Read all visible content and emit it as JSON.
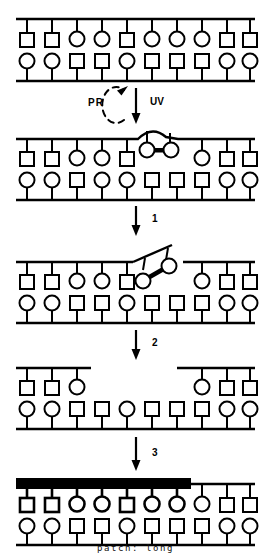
{
  "figure": {
    "caption": "patch: long",
    "stroke_color": "#000000",
    "patch_color": "#000000",
    "background": "#ffffff",
    "base_symbols": {
      "square": "square",
      "circle": "circle"
    },
    "labels": {
      "pr": "PR",
      "uv": "UV",
      "step1": "1",
      "step2": "2",
      "step3": "3"
    },
    "panels": [
      {
        "id": "panel-undamaged-dna",
        "name": "undamaged-duplex",
        "top_strand": [
          "square",
          "square",
          "circle",
          "circle",
          "square",
          "circle",
          "circle",
          "circle",
          "square",
          "square"
        ],
        "bottom_strand": [
          "circle",
          "circle",
          "square",
          "square",
          "circle",
          "square",
          "square",
          "square",
          "circle",
          "circle"
        ],
        "damage": null,
        "patch": null,
        "gap": null
      },
      {
        "id": "panel-dimer",
        "name": "uv-induced-pyrimidine-dimer",
        "top_strand": [
          "square",
          "square",
          "circle",
          "circle",
          "square",
          "circle",
          "circle",
          "circle",
          "square",
          "square"
        ],
        "bottom_strand": [
          "circle",
          "circle",
          "square",
          "square",
          "circle",
          "square",
          "square",
          "square",
          "circle",
          "circle"
        ],
        "damage": {
          "type": "pyrimidine-dimer",
          "positions": [
            6,
            7
          ]
        },
        "patch": null,
        "gap": null
      },
      {
        "id": "panel-incision",
        "name": "incised-strand-with-lifted-flap",
        "top_strand": [
          "square",
          "square",
          "circle",
          "circle",
          "square",
          "circle",
          "circle",
          "circle",
          "square",
          "square"
        ],
        "bottom_strand": [
          "circle",
          "circle",
          "square",
          "square",
          "circle",
          "square",
          "square",
          "square",
          "circle",
          "circle"
        ],
        "damage": {
          "type": "pyrimidine-dimer",
          "positions": [
            6,
            7
          ]
        },
        "incision": {
          "nick_after_position": 5,
          "flap_positions": [
            6,
            7
          ],
          "gap_after_position": 7
        },
        "patch": null
      },
      {
        "id": "panel-excision",
        "name": "excised-gap",
        "top_strand_left": [
          "square",
          "square",
          "circle"
        ],
        "top_strand_right": [
          "circle",
          "square",
          "square"
        ],
        "bottom_strand": [
          "circle",
          "circle",
          "square",
          "square",
          "circle",
          "square",
          "square",
          "square",
          "circle",
          "circle"
        ],
        "gap": {
          "missing_positions": [
            4,
            5,
            6,
            7
          ]
        },
        "damage": null,
        "patch": null
      },
      {
        "id": "panel-repair-patch",
        "name": "resynthesized-long-patch",
        "top_strand": [
          "square",
          "square",
          "circle",
          "circle",
          "square",
          "circle",
          "circle",
          "circle",
          "square",
          "square"
        ],
        "bottom_strand": [
          "circle",
          "circle",
          "square",
          "square",
          "circle",
          "square",
          "square",
          "square",
          "circle",
          "circle"
        ],
        "patch": {
          "type": "long",
          "covered_positions": [
            1,
            2,
            3,
            4,
            5,
            6,
            7
          ]
        },
        "damage": null,
        "gap": null
      }
    ],
    "arrows": [
      {
        "name": "uv-arrow",
        "label": "UV",
        "style": "solid-straight-down"
      },
      {
        "name": "pr-arrow",
        "label": "PR",
        "style": "dashed-curved-up"
      },
      {
        "name": "step-1-arrow",
        "label": "1",
        "style": "solid-straight-down"
      },
      {
        "name": "step-2-arrow",
        "label": "2",
        "style": "solid-straight-down"
      },
      {
        "name": "step-3-arrow",
        "label": "3",
        "style": "solid-straight-down"
      }
    ]
  }
}
